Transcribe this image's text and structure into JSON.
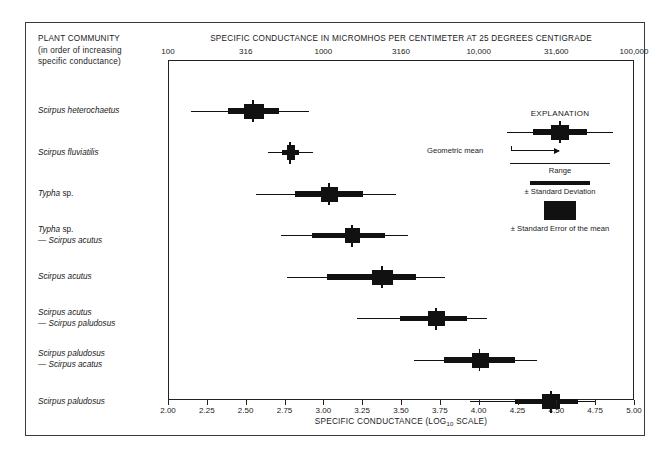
{
  "corner_heading": {
    "line1": "PLANT COMMUNITY",
    "line2": "(in order of increasing",
    "line3": "specific conductance)"
  },
  "main_title": "SPECIFIC CONDUCTANCE IN MICROMHOS PER CENTIMETER AT 25 DEGREES CENTIGRADE",
  "x_axis_title_pre": "SPECIFIC CONDUCTANCE (LOG",
  "x_axis_title_sub": "10",
  "x_axis_title_post": " SCALE)",
  "legend": {
    "title": "EXPLANATION",
    "geometric_mean": "Geometric mean",
    "range": "Range",
    "standard_deviation": "± Standard Deviation",
    "standard_error": "± Standard Error of the mean"
  },
  "chart_data": {
    "type": "bar",
    "title": "SPECIFIC CONDUCTANCE IN MICROMHOS PER CENTIMETER AT 25 DEGREES CENTIGRADE",
    "xlabel": "SPECIFIC CONDUCTANCE (LOG 10 SCALE)",
    "ylabel": "PLANT COMMUNITY (in order of increasing specific conductance)",
    "xlim": [
      2.0,
      5.0
    ],
    "grid": false,
    "legend_position": "inside-upper-right",
    "top_axis_label": "SPECIFIC CONDUCTANCE IN MICROMHOS PER CENTIMETER AT 25 DEGREES CENTIGRADE",
    "top_axis_ticks": [
      "100",
      "316",
      "1000",
      "3160",
      "10,000",
      "31,600",
      "100,000"
    ],
    "top_axis_tick_values": [
      2.0,
      2.5,
      3.0,
      3.5,
      4.0,
      4.5,
      5.0
    ],
    "bottom_axis_ticks": [
      "2.00",
      "2.25",
      "2.50",
      "2.75",
      "3.00",
      "3.25",
      "3.50",
      "3.75",
      "4.00",
      "4.25",
      "4.50",
      "4.75",
      "5.00"
    ],
    "bottom_axis_tick_values": [
      2.0,
      2.25,
      2.5,
      2.75,
      3.0,
      3.25,
      3.5,
      3.75,
      4.0,
      4.25,
      4.5,
      4.75,
      5.0
    ],
    "categories": [
      "Scirpus heterochaetus",
      "Scirpus fluviatilis",
      "Typha sp.",
      "Typha sp. — Scirpus acutus",
      "Scirpus acutus",
      "Scirpus acutus — Scirpus paludosus",
      "Scirpus paludosus — Scirpus acatus",
      "Scirpus paludosus"
    ],
    "series": [
      {
        "name": "Geometric mean",
        "values": [
          2.54,
          2.78,
          3.03,
          3.18,
          3.37,
          3.72,
          4.0,
          4.46
        ]
      },
      {
        "name": "Range minimum",
        "values": [
          2.14,
          2.64,
          2.56,
          2.72,
          2.76,
          3.21,
          3.58,
          3.94
        ]
      },
      {
        "name": "Range maximum",
        "values": [
          2.9,
          2.93,
          3.46,
          3.54,
          3.78,
          4.05,
          4.37,
          4.74
        ]
      },
      {
        "name": "Standard deviation minimum",
        "values": [
          2.38,
          2.73,
          2.81,
          2.92,
          3.02,
          3.49,
          3.77,
          4.23
        ]
      },
      {
        "name": "Standard deviation maximum",
        "values": [
          2.71,
          2.84,
          3.25,
          3.39,
          3.59,
          3.92,
          4.23,
          4.63
        ]
      },
      {
        "name": "Standard error minimum",
        "values": [
          2.48,
          2.76,
          2.98,
          3.13,
          3.31,
          3.67,
          3.95,
          4.4
        ]
      },
      {
        "name": "Standard error maximum",
        "values": [
          2.61,
          2.81,
          3.09,
          3.23,
          3.44,
          3.78,
          4.06,
          4.52
        ]
      }
    ]
  },
  "rows": [
    {
      "label_italic": "Scirpus heterochaetus",
      "label_second": "",
      "mean": 2.54,
      "range_min": 2.14,
      "range_max": 2.9,
      "sd_min": 2.38,
      "sd_max": 2.71,
      "se_min": 2.48,
      "se_max": 2.61
    },
    {
      "label_italic": "Scirpus fluviatilis",
      "label_second": "",
      "mean": 2.78,
      "range_min": 2.64,
      "range_max": 2.93,
      "sd_min": 2.73,
      "sd_max": 2.84,
      "se_min": 2.76,
      "se_max": 2.81
    },
    {
      "label_italic": "Typha",
      "label_plain": " sp.",
      "label_second": "",
      "mean": 3.03,
      "range_min": 2.56,
      "range_max": 3.46,
      "sd_min": 2.81,
      "sd_max": 3.25,
      "se_min": 2.98,
      "se_max": 3.09
    },
    {
      "label_italic": "Typha",
      "label_plain": " sp.",
      "label_second": "— Scirpus acutus",
      "mean": 3.18,
      "range_min": 2.72,
      "range_max": 3.54,
      "sd_min": 2.92,
      "sd_max": 3.39,
      "se_min": 3.13,
      "se_max": 3.23
    },
    {
      "label_italic": "Scirpus acutus",
      "label_second": "",
      "mean": 3.37,
      "range_min": 2.76,
      "range_max": 3.78,
      "sd_min": 3.02,
      "sd_max": 3.59,
      "se_min": 3.31,
      "se_max": 3.44
    },
    {
      "label_italic": "Scirpus acutus",
      "label_second": "— Scirpus paludosus",
      "mean": 3.72,
      "range_min": 3.21,
      "range_max": 4.05,
      "sd_min": 3.49,
      "sd_max": 3.92,
      "se_min": 3.67,
      "se_max": 3.78
    },
    {
      "label_italic": "Scirpus paludosus",
      "label_second": "— Scirpus acatus",
      "mean": 4.0,
      "range_min": 3.58,
      "range_max": 4.37,
      "sd_min": 3.77,
      "sd_max": 4.23,
      "se_min": 3.95,
      "se_max": 4.06
    },
    {
      "label_italic": "Scirpus paludosus",
      "label_second": "",
      "mean": 4.46,
      "range_min": 3.94,
      "range_max": 4.74,
      "sd_min": 4.23,
      "sd_max": 4.63,
      "se_min": 4.4,
      "se_max": 4.52
    }
  ]
}
